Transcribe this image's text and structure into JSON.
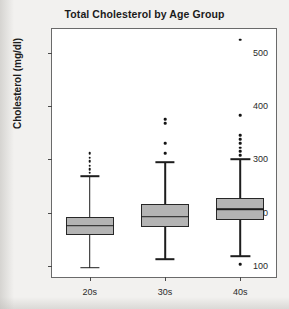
{
  "chart_data": {
    "type": "box",
    "title": "Total Cholesterol by Age Group",
    "xlabel": "",
    "ylabel": "Cholesterol (mg/dl)",
    "categories": [
      "20s",
      "30s",
      "40s"
    ],
    "ylim": [
      75,
      545
    ],
    "yticks": [
      100,
      200,
      300,
      400,
      500
    ],
    "ytick_labels": [
      "100",
      "200",
      "300",
      "400",
      "500"
    ],
    "grid": false,
    "legend": null,
    "box_fill_color": "#b4b4b4",
    "box_edge_color": "#272727",
    "plot_background": "#ffffff",
    "page_background": "#f2f1ef",
    "boxes": [
      {
        "category": "20s",
        "whisker_low": 96,
        "q1": 158,
        "median": 175,
        "q3": 192,
        "whisker_high": 268,
        "outliers": [
          275,
          281,
          288,
          296,
          303,
          312
        ]
      },
      {
        "category": "30s",
        "whisker_low": 112,
        "q1": 172,
        "median": 192,
        "q3": 216,
        "whisker_high": 295,
        "outliers": [
          312,
          330,
          368,
          375
        ]
      },
      {
        "category": "40s",
        "whisker_low": 118,
        "q1": 186,
        "median": 206,
        "q3": 228,
        "whisker_high": 300,
        "outliers": [
          103,
          308,
          315,
          322,
          330,
          338,
          345,
          383,
          525
        ]
      }
    ]
  }
}
